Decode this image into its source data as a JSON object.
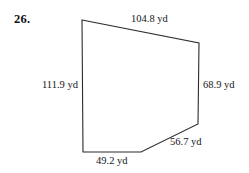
{
  "problem": {
    "number": "26."
  },
  "figure": {
    "shape_name": "irregular-pentagon",
    "unit": "yd",
    "stroke_color": "#2b2b2b",
    "fill_color": "#ffffff",
    "background_color": "#ffffff",
    "vertices": [
      {
        "name": "top-left",
        "x": 82,
        "y": 20
      },
      {
        "name": "top-right",
        "x": 199,
        "y": 43
      },
      {
        "name": "bottom-right",
        "x": 198,
        "y": 124
      },
      {
        "name": "bend-bottom",
        "x": 141,
        "y": 152
      },
      {
        "name": "bottom-left",
        "x": 83,
        "y": 152
      }
    ],
    "sides": [
      {
        "name": "top-side",
        "label": "104.8 yd",
        "value": 104.8
      },
      {
        "name": "right-side",
        "label": "68.9 yd",
        "value": 68.9
      },
      {
        "name": "lower-right-side",
        "label": "56.7 yd",
        "value": 56.7
      },
      {
        "name": "bottom-side",
        "label": "49.2 yd",
        "value": 49.2
      },
      {
        "name": "left-side",
        "label": "111.9 yd",
        "value": 111.9
      }
    ]
  }
}
